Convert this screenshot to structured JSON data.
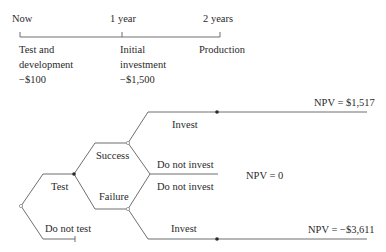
{
  "timeline": {
    "points": [
      {
        "label": "Now"
      },
      {
        "label": "1 year"
      },
      {
        "label": "2 years"
      }
    ],
    "stages": [
      {
        "line1": "Test and",
        "line2": "development",
        "line3": "−$100"
      },
      {
        "line1": "Initial",
        "line2": "investment",
        "line3": "−$1,500"
      },
      {
        "line1": "Production"
      }
    ]
  },
  "tree": {
    "first_decision": {
      "test": "Test",
      "do_not_test": "Do not test"
    },
    "chance": {
      "success": "Success",
      "failure": "Failure"
    },
    "second_decision": {
      "success_invest": "Invest",
      "success_do_not_invest": "Do not invest",
      "failure_do_not_invest": "Do not invest",
      "failure_invest": "Invest"
    },
    "outcomes": {
      "success_invest": "NPV = $1,517",
      "do_not_invest": "NPV = 0",
      "failure_invest": "NPV = −$3,611"
    }
  },
  "colors": {
    "line": "#6f6f6f",
    "text": "#2a2a2a"
  }
}
